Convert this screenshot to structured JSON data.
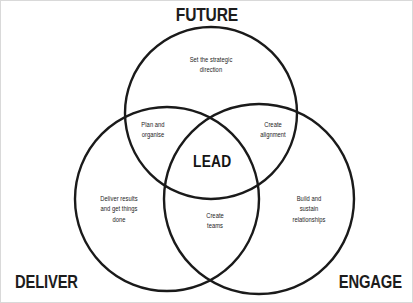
{
  "diagram": {
    "type": "venn-3-circle",
    "title": "LEAD",
    "background_color": "#ffffff",
    "stroke_color": "#1a1a1a",
    "text_color": "#1d1d1d",
    "circles": [
      {
        "key": "future",
        "label": "FUTURE",
        "cx": 210,
        "cy": 112,
        "r": 86
      },
      {
        "key": "deliver",
        "label": "DELIVER",
        "cx": 166,
        "cy": 198,
        "r": 92
      },
      {
        "key": "engage",
        "label": "ENGAGE",
        "cx": 258,
        "cy": 198,
        "r": 95
      }
    ],
    "labels": {
      "future": "FUTURE",
      "deliver": "DELIVER",
      "engage": "ENGAGE"
    },
    "regions": {
      "future_only": "Set the strategic\ndirection",
      "future_deliver": "Plan and\norganise",
      "future_engage": "Create\nalignment",
      "deliver_only": "Deliver results\nand get things\ndone",
      "deliver_engage": "Create\nteams",
      "engage_only": "Build and\nsustain\nrelationships",
      "center": "LEAD"
    }
  }
}
